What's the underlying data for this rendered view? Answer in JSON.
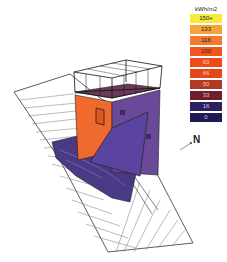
{
  "diagram": {
    "type": "3d-solar-radiation-analysis",
    "legend": {
      "unit": "kWh/m2",
      "items": [
        {
          "label": "150+",
          "color": "#f7ea3a",
          "text_color": "#222"
        },
        {
          "label": "133",
          "color": "#f6a43a",
          "text_color": "#222"
        },
        {
          "label": "116",
          "color": "#f47a2e",
          "text_color": "#222"
        },
        {
          "label": "100",
          "color": "#f2561e",
          "text_color": "#222"
        },
        {
          "label": "83",
          "color": "#ee4a1a",
          "text_color": "#f7c9b8"
        },
        {
          "label": "66",
          "color": "#e6451c",
          "text_color": "#f7c9b8"
        },
        {
          "label": "50",
          "color": "#b33a22",
          "text_color": "#f0c8b8"
        },
        {
          "label": "33",
          "color": "#6e1e2c",
          "text_color": "#e6c0c8"
        },
        {
          "label": "16",
          "color": "#2e1f5e",
          "text_color": "#c8c0e8"
        },
        {
          "label": "0",
          "color": "#1e1a52",
          "text_color": "#c8c0e8"
        }
      ]
    },
    "north_label": "N"
  }
}
